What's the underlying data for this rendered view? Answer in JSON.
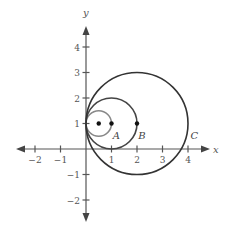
{
  "diagram": {
    "origin_px": [
      86,
      149
    ],
    "unit_px": 25.5,
    "axes": {
      "x_label": "x",
      "y_label": "y",
      "x_range": [
        -2.7,
        4.8
      ],
      "y_range": [
        -2.8,
        4.8
      ],
      "x_ticks": [
        {
          "value": -2,
          "label": "−2"
        },
        {
          "value": -1,
          "label": "−1"
        },
        {
          "value": 1,
          "label": "1"
        },
        {
          "value": 2,
          "label": "2"
        },
        {
          "value": 3,
          "label": "3"
        },
        {
          "value": 4,
          "label": "4"
        }
      ],
      "y_ticks": [
        {
          "value": 4,
          "label": "4"
        },
        {
          "value": 3,
          "label": "3"
        },
        {
          "value": 2,
          "label": "2"
        },
        {
          "value": 1,
          "label": "1"
        },
        {
          "value": -1,
          "label": "−1"
        },
        {
          "value": -2,
          "label": "−2"
        }
      ]
    },
    "circles": [
      {
        "name": "A",
        "center": [
          0.5,
          1
        ],
        "radius": 0.5,
        "color": "#888888"
      },
      {
        "name": "B",
        "center": [
          1,
          1
        ],
        "radius": 1,
        "color": "#444444"
      },
      {
        "name": "C",
        "center": [
          2,
          1
        ],
        "radius": 2,
        "color": "#333333"
      }
    ],
    "points": [
      {
        "x": 0.5,
        "y": 1
      },
      {
        "x": 1,
        "y": 1
      },
      {
        "x": 2,
        "y": 1
      }
    ],
    "labels": [
      {
        "text": "A",
        "x": 1.05,
        "y": 0.55
      },
      {
        "text": "B",
        "x": 2.05,
        "y": 0.55
      },
      {
        "text": "C",
        "x": 4.1,
        "y": 0.55
      }
    ]
  }
}
